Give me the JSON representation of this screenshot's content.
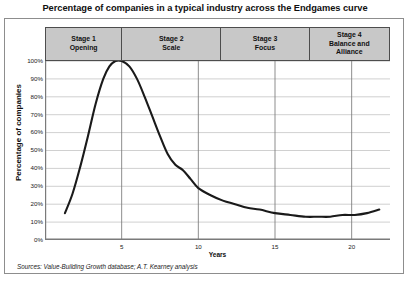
{
  "chart_data": {
    "type": "line",
    "title": "Percentage of companies in a typical industry across the Endgames curve",
    "xlabel": "Years",
    "ylabel": "Percentage of companies",
    "xlim": [
      0,
      22.5
    ],
    "ylim": [
      0,
      100
    ],
    "grid": true,
    "legend": null,
    "y_ticks": [
      "0%",
      "10%",
      "20%",
      "30%",
      "40%",
      "50%",
      "60%",
      "70%",
      "80%",
      "90%",
      "100%"
    ],
    "y_tick_values": [
      0,
      10,
      20,
      30,
      40,
      50,
      60,
      70,
      80,
      90,
      100
    ],
    "x_ticks": [
      "5",
      "10",
      "15",
      "20"
    ],
    "x_tick_values": [
      5,
      10,
      15,
      20
    ],
    "series": [
      {
        "name": "Percentage of companies",
        "x": [
          1.3,
          1.8,
          2.3,
          2.8,
          3.3,
          3.8,
          4.2,
          4.6,
          5.0,
          5.5,
          6.0,
          6.5,
          7.0,
          7.5,
          8.0,
          8.5,
          9.0,
          9.5,
          10.0,
          10.8,
          11.6,
          12.4,
          13.2,
          14.0,
          15.0,
          16.0,
          17.0,
          17.8,
          18.6,
          19.4,
          20.2,
          21.0,
          21.8
        ],
        "values": [
          15,
          26,
          41,
          58,
          76,
          90,
          97,
          100,
          100,
          97,
          90,
          80,
          69,
          58,
          48,
          42,
          39,
          34,
          29,
          25,
          22,
          20,
          18,
          17,
          15,
          14,
          13,
          13,
          13,
          14,
          14,
          15,
          17
        ]
      }
    ],
    "annotations": [
      {
        "label": "Stage 1",
        "sublabel": "Opening",
        "x_start": 0,
        "x_end": 5.0
      },
      {
        "label": "Stage 2",
        "sublabel": "Scale",
        "x_start": 5.0,
        "x_end": 11.5
      },
      {
        "label": "Stage 3",
        "sublabel": "Focus",
        "x_start": 11.5,
        "x_end": 17.3
      },
      {
        "label": "Stage 4",
        "sublabel": "Balance and Alliance",
        "x_start": 17.3,
        "x_end": 22.5
      }
    ],
    "source": "Sources: Value-Building Growth database; A.T. Kearney analysis",
    "colors": {
      "curve": "#1a1a1a",
      "grid": "#c4c4c4",
      "axis": "#7a7a7a",
      "stage_band_fill": "#c8c8c8",
      "stage_band_border": "#4d4d4d",
      "frame_border": "#8d8d8d",
      "text": "#101010"
    }
  },
  "stages": [
    {
      "name": "Stage 1",
      "descriptor": "Opening",
      "width_pct": 22.3
    },
    {
      "name": "Stage 2",
      "descriptor": "Scale",
      "width_pct": 29.0
    },
    {
      "name": "Stage 3",
      "descriptor": "Focus",
      "width_pct": 26.4
    },
    {
      "name": "Stage 4",
      "descriptor": "Balance and",
      "descriptor2": "Alliance",
      "width_pct": 22.3
    }
  ],
  "footer": {
    "source": "Sources: Value-Building Growth database; A.T. Kearney analysis"
  }
}
